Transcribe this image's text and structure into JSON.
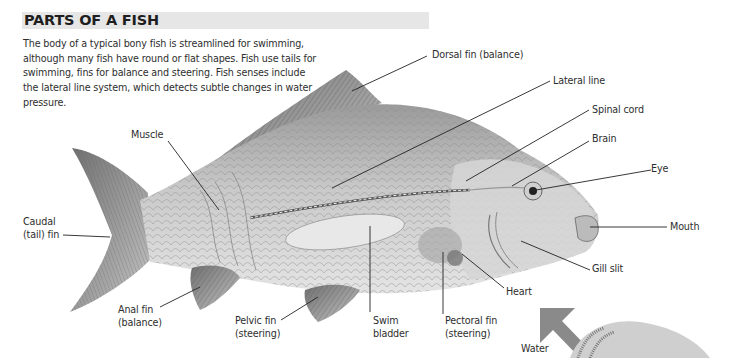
{
  "header": {
    "title": "PARTS OF A FISH",
    "intro": "The body of a typical bony fish is streamlined for swimming, although many fish have round or flat shapes. Fish use tails for swimming, fins for balance and steering. Fish senses include the lateral line system, which detects subtle changes in water pressure."
  },
  "labels": {
    "dorsal_fin": "Dorsal fin (balance)",
    "lateral_line": "Lateral line",
    "spinal_cord": "Spinal cord",
    "brain": "Brain",
    "eye": "Eye",
    "mouth": "Mouth",
    "gill_slit": "Gill slit",
    "heart": "Heart",
    "muscle": "Muscle",
    "caudal_fin_1": "Caudal",
    "caudal_fin_2": "(tail) fin",
    "anal_fin_1": "Anal fin",
    "anal_fin_2": "(balance)",
    "pelvic_fin_1": "Pelvic fin",
    "pelvic_fin_2": "(steering)",
    "swim_bladder_1": "Swim",
    "swim_bladder_2": "bladder",
    "pectoral_fin_1": "Pectoral fin",
    "pectoral_fin_2": "(steering)",
    "water": "Water"
  },
  "colors": {
    "title_bar": "#e6e6e6",
    "arrow": "#8a8a8a",
    "illustration": "#bdbdbd"
  }
}
